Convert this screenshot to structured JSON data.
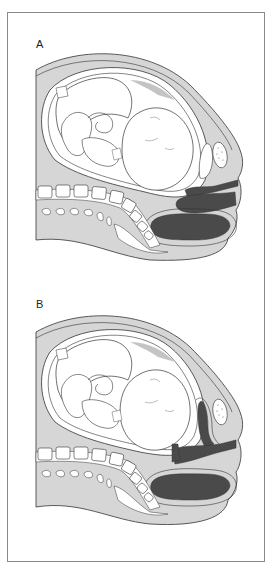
{
  "figure": {
    "panels": [
      {
        "id": "A",
        "label": "A"
      },
      {
        "id": "B",
        "label": "B"
      }
    ],
    "colors": {
      "outline": "#333333",
      "tissue_light": "#d6d6d6",
      "tissue_mid": "#c4c4c4",
      "organ_dark": "#4a4a4a",
      "white": "#ffffff",
      "frame": "#8a8a8a"
    }
  }
}
